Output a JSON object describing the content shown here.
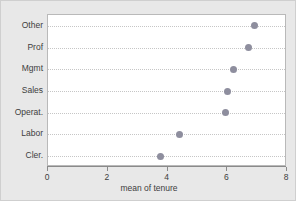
{
  "chart_data": {
    "type": "scatter",
    "title": "",
    "subtitle": "",
    "xlabel": "mean of tenure",
    "ylabel": "",
    "xlim": [
      0,
      8
    ],
    "xticks": [
      0,
      2,
      4,
      6,
      8
    ],
    "xtick_labels": [
      "0",
      "2",
      "4",
      "6",
      "8"
    ],
    "grid": true,
    "grid_orientation": "horizontal",
    "legend": null,
    "categories": [
      "Other",
      "Prof",
      "Mgmt",
      "Sales",
      "Operat.",
      "Labor",
      "Cler."
    ],
    "values": [
      6.9,
      6.7,
      6.2,
      6.0,
      5.95,
      4.4,
      3.75
    ],
    "marker_color": "#8e8e9e",
    "plot_background": "#ffffff",
    "figure_background": "#e8e8e8"
  },
  "axis": {
    "x_title": "mean of tenure",
    "tick_0": "0",
    "tick_1": "2",
    "tick_2": "4",
    "tick_3": "6",
    "tick_4": "8"
  },
  "rows": [
    {
      "label": "Other",
      "value": 6.9
    },
    {
      "label": "Prof",
      "value": 6.7
    },
    {
      "label": "Mgmt",
      "value": 6.2
    },
    {
      "label": "Sales",
      "value": 6.0
    },
    {
      "label": "Operat.",
      "value": 5.95
    },
    {
      "label": "Labor",
      "value": 4.4
    },
    {
      "label": "Cler.",
      "value": 3.75
    }
  ]
}
